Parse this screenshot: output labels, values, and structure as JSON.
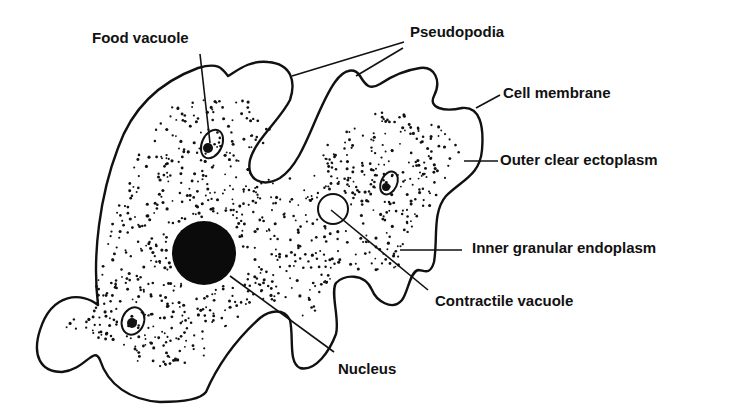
{
  "diagram": {
    "colors": {
      "ink": "#111111",
      "background": "#ffffff"
    },
    "labels": [
      {
        "id": "food-vacuole",
        "text": "Food vacuole",
        "x": 92,
        "y": 30
      },
      {
        "id": "pseudopodia",
        "text": "Pseudopodia",
        "x": 410,
        "y": 24
      },
      {
        "id": "cell-membrane",
        "text": "Cell membrane",
        "x": 503,
        "y": 85
      },
      {
        "id": "outer-clear-ectoplasm",
        "text": "Outer clear ectoplasm",
        "x": 500,
        "y": 152
      },
      {
        "id": "inner-granular-endoplasm",
        "text": "Inner granular endoplasm",
        "x": 472,
        "y": 240
      },
      {
        "id": "contractile-vacuole",
        "text": "Contractile vacuole",
        "x": 435,
        "y": 293
      },
      {
        "id": "nucleus",
        "text": "Nucleus",
        "x": 338,
        "y": 361
      }
    ]
  }
}
